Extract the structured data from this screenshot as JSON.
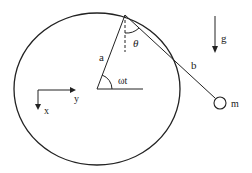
{
  "diagram": {
    "labels": {
      "radius": "a",
      "pendulum_length": "b",
      "pendulum_angle": "θ",
      "rotation_angle": "ωt",
      "gravity": "g",
      "mass": "m",
      "axis_x": "x",
      "axis_y": "y"
    },
    "colors": {
      "stroke": "#222222",
      "background": "#ffffff"
    }
  }
}
